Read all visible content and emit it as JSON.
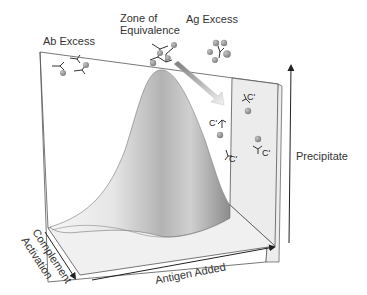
{
  "diagram": {
    "type": "3d-precipitin-curve",
    "regions": {
      "antibody_excess": "Ab Excess",
      "equivalence_line1": "Zone of",
      "equivalence_line2": "Equivalence",
      "antigen_excess": "Ag Excess"
    },
    "axes": {
      "vertical": "Precipitate",
      "horizontal": "Antigen Added",
      "depth_line1": "Complement",
      "depth_line2": "Activation"
    },
    "complement_label": "C'",
    "complement_marks": [
      "C'",
      "C'",
      "C'",
      "C'"
    ],
    "colors": {
      "line": "#444444",
      "wall_back": "#ffffff",
      "wall_side": "#ececec",
      "floor": "#f1f1f1",
      "curve_light": "#f4f4f4",
      "curve_dark": "#9a9a9a",
      "antigen": "#8f8f8f",
      "arrow": "#d8d8d8",
      "text": "#333333"
    }
  }
}
